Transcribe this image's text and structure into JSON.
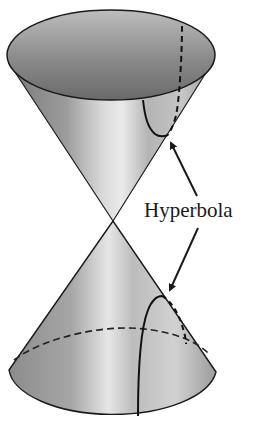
{
  "figure": {
    "label": "Hyperbola",
    "components": [
      "upper-nappe",
      "lower-nappe",
      "hyperbola-upper-branch",
      "hyperbola-lower-branch"
    ],
    "arrow_count": 2
  },
  "colors": {
    "outline": "#1a1a1a",
    "shade_dark": "#6e6e6e",
    "shade_mid": "#a8a8a8",
    "shade_light": "#dedede",
    "background": "#ffffff"
  }
}
